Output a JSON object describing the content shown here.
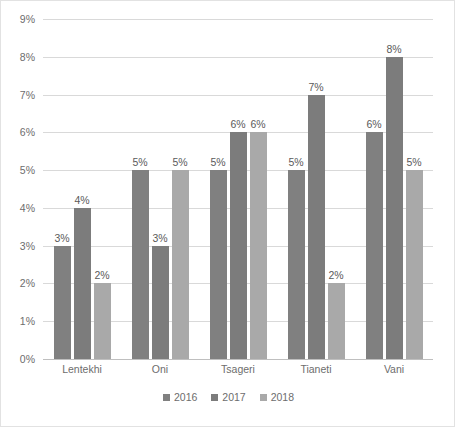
{
  "chart_data": {
    "type": "bar",
    "title": "",
    "subtitle": "",
    "xlabel": "",
    "ylabel": "",
    "categories": [
      "Lentekhi",
      "Oni",
      "Tsageri",
      "Tianeti",
      "Vani"
    ],
    "series": [
      {
        "name": "2016",
        "color": "#808080",
        "values": [
          3,
          5,
          5,
          5,
          6
        ],
        "labels": [
          "3%",
          "5%",
          "5%",
          "5%",
          "6%"
        ]
      },
      {
        "name": "2017",
        "color": "#7c7c7c",
        "values": [
          4,
          3,
          6,
          7,
          8
        ],
        "labels": [
          "4%",
          "3%",
          "6%",
          "7%",
          "8%"
        ]
      },
      {
        "name": "2018",
        "color": "#a9a9a9",
        "values": [
          2,
          5,
          6,
          2,
          5
        ],
        "labels": [
          "2%",
          "5%",
          "6%",
          "2%",
          "5%"
        ]
      }
    ],
    "ylim": [
      0,
      9
    ],
    "ytick_values": [
      0,
      1,
      2,
      3,
      4,
      5,
      6,
      7,
      8,
      9
    ],
    "ytick_labels": [
      "0%",
      "1%",
      "2%",
      "3%",
      "4%",
      "5%",
      "6%",
      "7%",
      "8%",
      "9%"
    ],
    "grid": true,
    "grid_axis": "y",
    "legend_position": "bottom-center",
    "data_labels": true,
    "value_suffix": "%",
    "gridline_color": "#d9d9d9",
    "axis_color": "#bfbfbf",
    "text_color": "#6d6d6d",
    "label_text_color": "#5a5a5a",
    "plot_background": "#ffffff",
    "border_color": "#e2e2e2"
  }
}
